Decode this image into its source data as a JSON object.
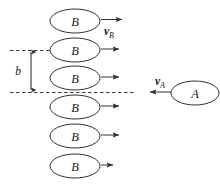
{
  "figure": {
    "background_color": "#ffffff",
    "stroke_color": "#303030",
    "width": 220,
    "height": 186
  },
  "beam": {
    "particle_label": "B",
    "velocity_label": "v",
    "velocity_subscript": "B",
    "count": 6,
    "particles": [
      {
        "label": "B",
        "cx": 75,
        "cy": 21,
        "rx": 25,
        "ry": 12,
        "arrow_x2": 122,
        "has_velocity_label": true
      },
      {
        "label": "B",
        "cx": 75,
        "cy": 50,
        "rx": 25,
        "ry": 12,
        "arrow_x2": 119,
        "has_velocity_label": false
      },
      {
        "label": "B",
        "cx": 75,
        "cy": 78,
        "rx": 25,
        "ry": 12,
        "arrow_x2": 119,
        "has_velocity_label": false
      },
      {
        "label": "B",
        "cx": 75,
        "cy": 107,
        "rx": 25,
        "ry": 12,
        "arrow_x2": 119,
        "has_velocity_label": false
      },
      {
        "label": "B",
        "cx": 75,
        "cy": 136,
        "rx": 25,
        "ry": 12,
        "arrow_x2": 119,
        "has_velocity_label": false
      },
      {
        "label": "B",
        "cx": 75,
        "cy": 166,
        "rx": 25,
        "ry": 12,
        "arrow_x2": 113,
        "has_velocity_label": false
      }
    ]
  },
  "projectile": {
    "particle_label": "A",
    "velocity_label": "v",
    "velocity_subscript": "A",
    "cx": 195,
    "cy": 93,
    "rx": 24,
    "ry": 12,
    "arrow_from_x": 170,
    "arrow_to_x": 149
  },
  "impact_parameter": {
    "label": "b",
    "label_x": 18,
    "label_y": 75,
    "line_x": 31,
    "top_y": 50,
    "bottom_y": 92
  },
  "guide_lines": [
    {
      "name": "upper-dashed-guide",
      "x1": 10,
      "x2": 62,
      "y": 50
    },
    {
      "name": "lower-dashed-guide",
      "x1": 10,
      "x2": 136,
      "y": 92
    }
  ]
}
